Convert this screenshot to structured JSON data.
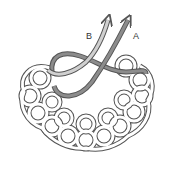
{
  "diagram": {
    "type": "knot-tying illustration",
    "labels": {
      "strand_b": "B",
      "strand_a": "A"
    },
    "colors": {
      "background": "#ffffff",
      "rope_outline": "#555555",
      "rope_fill": "#ffffff",
      "strand_a": "#8c8c8c",
      "strand_b": "#c8c8c8"
    }
  }
}
